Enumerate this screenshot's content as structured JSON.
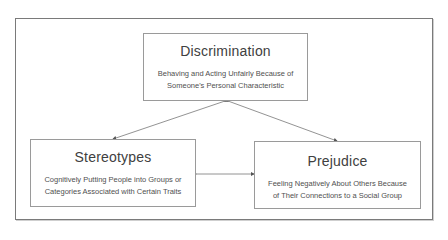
{
  "diagram": {
    "nodes": [
      {
        "id": "discrimination",
        "title": "Discrimination",
        "lines": [
          "Behaving and Acting Unfairly Because of",
          "Someone's Personal Characteristic"
        ]
      },
      {
        "id": "stereotypes",
        "title": "Stereotypes",
        "lines": [
          "Cognitively Putting People into Groups or",
          "Categories Associated with Certain Traits"
        ]
      },
      {
        "id": "prejudice",
        "title": "Prejudice",
        "lines": [
          "Feeling Negatively About Others Because",
          "of Their Connections to a Social Group"
        ]
      }
    ],
    "edges": [
      {
        "from": "discrimination",
        "to": "stereotypes",
        "type": "bidirectional"
      },
      {
        "from": "discrimination",
        "to": "prejudice",
        "type": "bidirectional"
      },
      {
        "from": "stereotypes",
        "to": "prejudice",
        "type": "bidirectional"
      }
    ]
  }
}
